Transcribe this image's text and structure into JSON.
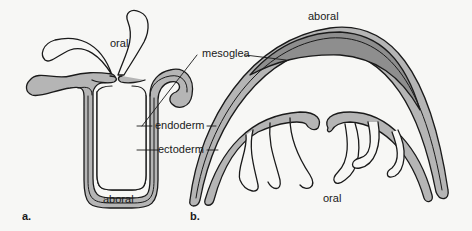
{
  "figure": {
    "panels": [
      {
        "id": "a",
        "label": "a.",
        "orientation_top": "oral",
        "orientation_bottom": "aboral",
        "form": "polyp"
      },
      {
        "id": "b",
        "label": "b.",
        "orientation_top": "aboral",
        "orientation_bottom": "oral",
        "form": "medusa"
      }
    ],
    "layer_labels": {
      "mesoglea": "mesoglea",
      "endoderm": "endoderm",
      "ectoderm": "ectoderm"
    },
    "colors": {
      "background": "#f7f7f5",
      "outline": "#1a1a1a",
      "layer_fill": "#b5b5b5",
      "mesoglea_fill": "#8e8e8e",
      "cavity_fill": "#f7f7f5"
    }
  }
}
